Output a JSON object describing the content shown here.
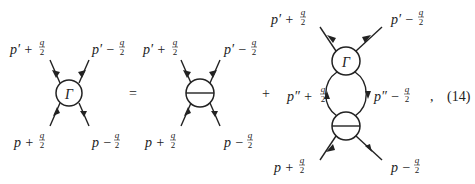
{
  "equation": {
    "number": "(14)",
    "equals": "=",
    "plus": "+",
    "comma": ",",
    "vertex_symbol": "Γ"
  },
  "diagram1": {
    "vertex": "Γ",
    "labels": {
      "top_left": "p′ + q/2",
      "top_right": "p′ − q/2",
      "bottom_left": "p + q/2",
      "bottom_right": "p − q/2"
    }
  },
  "diagram2": {
    "vertex": "barred-circle",
    "labels": {
      "top_left": "p′ + q/2",
      "top_right": "p′ − q/2",
      "bottom_left": "p + q/2",
      "bottom_right": "p − q/2"
    }
  },
  "diagram3": {
    "top_vertex": "Γ",
    "bottom_vertex": "barred-circle",
    "labels": {
      "top_left": "p′ + q/2",
      "top_right": "p′ − q/2",
      "loop_left": "p″ + q/2",
      "loop_right": "p″ − q/2",
      "bottom_left": "p + q/2",
      "bottom_right": "p − q/2"
    }
  }
}
